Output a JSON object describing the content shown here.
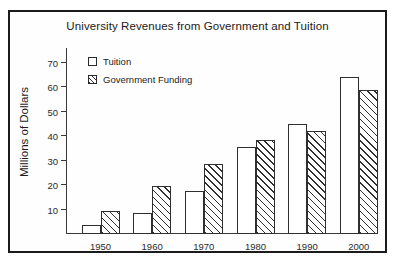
{
  "chart_data": {
    "type": "bar",
    "title": "University Revenues from Government and Tuition",
    "xlabel": "",
    "ylabel": "Millions of Dollars",
    "categories": [
      "1950",
      "1960",
      "1970",
      "1980",
      "1990",
      "2000"
    ],
    "series": [
      {
        "name": "Tuition",
        "values": [
          3.5,
          8.5,
          17.5,
          35.5,
          45,
          64
        ]
      },
      {
        "name": "Government Funding",
        "values": [
          9.5,
          19.5,
          28.5,
          38.5,
          42,
          59
        ]
      }
    ],
    "yticks": [
      10,
      20,
      30,
      40,
      50,
      60,
      70
    ],
    "ylim": [
      0,
      76
    ],
    "grid": false,
    "legend_position": "top-left",
    "colors": {
      "tuition": "#ffffff",
      "government": "#2f2f2f",
      "axis": "#3a3a3a",
      "frame": "#1b1b1b"
    }
  }
}
